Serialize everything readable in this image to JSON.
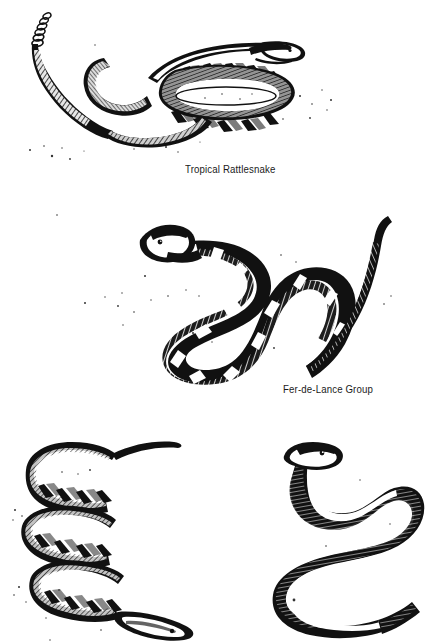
{
  "plate": {
    "background_color": "#ffffff",
    "ink_color": "#111111",
    "medium": "pen-and-ink scratchboard illustration",
    "width": 434,
    "height": 643
  },
  "figures": [
    {
      "id": "tropical-rattlesnake",
      "caption": "Tropical Rattlesnake",
      "caption_x": 185,
      "caption_y": 163,
      "pose": "coiled with raised head and erect rattle",
      "features": [
        "rattle",
        "diamond-chain dorsal pattern",
        "stippled ground shadow"
      ]
    },
    {
      "id": "fer-de-lance-group",
      "caption": "Fer-de-Lance Group",
      "caption_x": 283,
      "caption_y": 383,
      "pose": "S-curved crawling posture, head raised at upper left, mouth open",
      "features": [
        "dark body with pale cross-bands",
        "slender tapering tail",
        "stippled ground shadow"
      ]
    },
    {
      "id": "lower-left-snake",
      "caption": "",
      "pose": "tightly stacked horizontal coils, head at lower right",
      "features": [
        "chevron / zigzag dorsal pattern",
        "hatched shading"
      ]
    },
    {
      "id": "lower-right-snake",
      "caption": "",
      "pose": "vertical switchback S-curves, head at top",
      "features": [
        "solid dark dorsum",
        "pale belly stripe"
      ]
    }
  ],
  "captions": {
    "one": "Tropical Rattlesnake",
    "two": "Fer-de-Lance Group"
  }
}
